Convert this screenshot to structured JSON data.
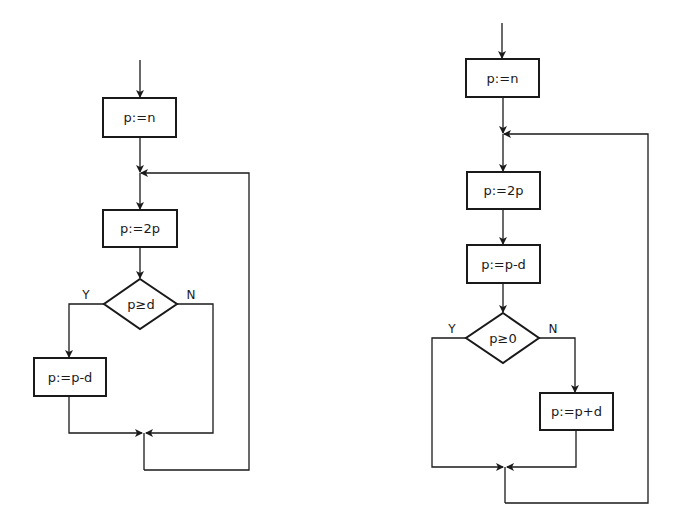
{
  "flowcharts": [
    {
      "name": "left",
      "boxes": [
        "p:=n",
        "p:=2p",
        "p:=p-d"
      ],
      "decision": {
        "label": "p≥d",
        "yes": "Y",
        "no": "N"
      }
    },
    {
      "name": "right",
      "boxes": [
        "p:=n",
        "p:=2p",
        "p:=p-d",
        "p:=p+d"
      ],
      "decision": {
        "label": "p≥0",
        "yes": "Y",
        "no": "N"
      }
    }
  ],
  "colors": {
    "stroke": "#1a1a1a",
    "background": "#ffffff"
  }
}
